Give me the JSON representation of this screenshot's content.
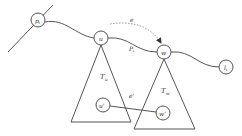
{
  "diagram": {
    "stroke_color": "#444444",
    "nodes": {
      "p": {
        "label": "p",
        "sub": "i"
      },
      "u": {
        "label": "u"
      },
      "w": {
        "label": "w"
      },
      "l": {
        "label": "l",
        "sub": "i"
      },
      "u_prime": {
        "label": "u'"
      },
      "w_prime": {
        "label": "w'"
      }
    },
    "trees": {
      "tu": {
        "label": "T",
        "sub": "u"
      },
      "tw": {
        "label": "T",
        "sub": "w"
      }
    },
    "edges": {
      "e": {
        "label": "e"
      },
      "e_prime": {
        "label": "e'"
      },
      "path": {
        "label": "P",
        "sub": "i"
      }
    }
  }
}
